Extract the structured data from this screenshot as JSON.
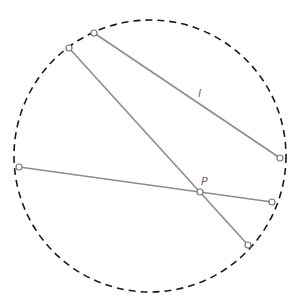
{
  "diagram": {
    "type": "geometry",
    "colors": {
      "circle": "#1a1a1a",
      "segment": "#8c8c8c",
      "point_stroke": "#7a7a7a",
      "point_fill": "#ffffff",
      "label": "#666666"
    },
    "circle": {
      "cx": 150,
      "cy": 156,
      "r": 136,
      "style": "dashed"
    },
    "points": {
      "A": {
        "x": 94,
        "y": 33
      },
      "B": {
        "x": 69,
        "y": 48
      },
      "C": {
        "x": 280,
        "y": 158
      },
      "D": {
        "x": 19,
        "y": 167
      },
      "E": {
        "x": 272,
        "y": 202
      },
      "F": {
        "x": 248,
        "y": 245
      },
      "P": {
        "x": 200,
        "y": 192
      }
    },
    "segments": [
      {
        "name": "line-l",
        "from": "A",
        "to": "C"
      },
      {
        "name": "chord-BF",
        "from": "B",
        "to": "F"
      },
      {
        "name": "chord-DE",
        "from": "D",
        "to": "E"
      }
    ],
    "labels": {
      "l": {
        "text": "l",
        "x": 198,
        "y": 97
      },
      "P": {
        "text": "P",
        "x": 201,
        "y": 185
      }
    }
  }
}
